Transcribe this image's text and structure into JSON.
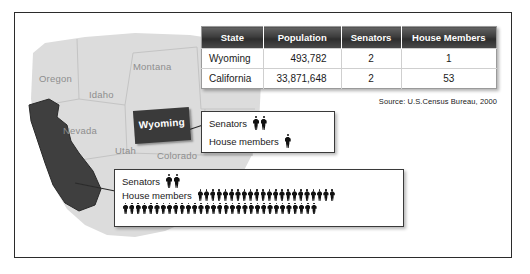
{
  "figure": {
    "source_note": "Source: U.S.Census Bureau, 2000"
  },
  "map": {
    "state_labels": [
      {
        "name": "Oregon",
        "text": "Oregon"
      },
      {
        "name": "Montana",
        "text": "Montana"
      },
      {
        "name": "Idaho",
        "text": "Idaho"
      },
      {
        "name": "Nevada",
        "text": "Nevada"
      },
      {
        "name": "Utah",
        "text": "Utah"
      },
      {
        "name": "Colorado",
        "text": "Colorado"
      }
    ],
    "highlighted": {
      "wyoming_label": "Wyoming",
      "california_label": "California"
    },
    "colors": {
      "land": "#dcdcdc",
      "highlight": "#3a3a3a",
      "label_text": "#8e8e8e",
      "border": "#2b2b2b"
    }
  },
  "table": {
    "headers": [
      "State",
      "Population",
      "Senators",
      "House Members"
    ],
    "rows": [
      {
        "state": "Wyoming",
        "population": "493,782",
        "senators": "2",
        "house_members": "1"
      },
      {
        "state": "California",
        "population": "33,871,648",
        "senators": "2",
        "house_members": "53"
      }
    ],
    "header_bg": "#3c3c3c",
    "header_text": "#ffffff"
  },
  "callouts": [
    {
      "name": "wyoming-callout",
      "state": "Wyoming",
      "senators_label": "Senators",
      "senators_count": 2,
      "house_label": "House members",
      "house_count": 1,
      "house_rows": [
        1
      ]
    },
    {
      "name": "california-callout",
      "state": "California",
      "senators_label": "Senators",
      "senators_count": 2,
      "house_label": "House members",
      "house_count": 53,
      "house_rows": [
        22,
        31
      ]
    }
  ]
}
